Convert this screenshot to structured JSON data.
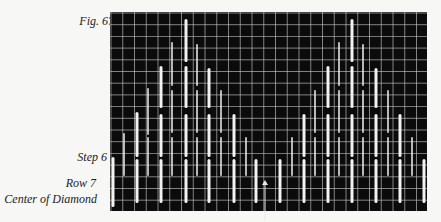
{
  "figure": {
    "caption": "Fig. 67",
    "labels": {
      "step": "Step 6",
      "row": "Row 7",
      "center": "Center of Diamond"
    }
  },
  "colors": {
    "background": "#0b0b0b",
    "grid": "#c8c8c8",
    "bar": "#f2f2f2",
    "page": "#f7f7f5"
  },
  "grid": {
    "left": 110,
    "top": 12,
    "right": 427,
    "bottom": 211,
    "spacing_x": 11.75,
    "spacing_y": 11.7
  },
  "diamonds": [
    {
      "name": "left",
      "bars": [
        {
          "x": 113,
          "w": 3,
          "segs": [
            [
              157,
              207
            ]
          ]
        },
        {
          "x": 124,
          "w": 1.5,
          "segs": [
            [
              133,
              176
            ]
          ]
        },
        {
          "x": 137,
          "w": 3,
          "segs": [
            [
              112,
              157
            ],
            [
              159,
              203
            ]
          ]
        },
        {
          "x": 148,
          "w": 1.5,
          "segs": [
            [
              88,
              135
            ],
            [
              137,
              176
            ]
          ]
        },
        {
          "x": 161,
          "w": 3,
          "segs": [
            [
              66,
              108
            ],
            [
              114,
              157
            ],
            [
              159,
              203
            ]
          ]
        },
        {
          "x": 172,
          "w": 1.5,
          "segs": [
            [
              42,
              86
            ],
            [
              90,
              133
            ],
            [
              137,
              176
            ]
          ]
        },
        {
          "x": 186,
          "w": 3,
          "segs": [
            [
              19,
              62
            ],
            [
              66,
              108
            ],
            [
              114,
              157
            ],
            [
              159,
              203
            ]
          ]
        },
        {
          "x": 197,
          "w": 1.5,
          "segs": [
            [
              44,
              86
            ],
            [
              90,
              133
            ],
            [
              137,
              176
            ]
          ]
        },
        {
          "x": 209,
          "w": 3,
          "segs": [
            [
              68,
              108
            ],
            [
              114,
              157
            ],
            [
              159,
              203
            ]
          ]
        },
        {
          "x": 221,
          "w": 1.5,
          "segs": [
            [
              90,
              133
            ],
            [
              137,
              176
            ]
          ]
        },
        {
          "x": 234,
          "w": 3,
          "segs": [
            [
              114,
              157
            ],
            [
              159,
              203
            ]
          ]
        },
        {
          "x": 246,
          "w": 1.5,
          "segs": [
            [
              137,
              176
            ]
          ]
        },
        {
          "x": 256,
          "w": 3,
          "segs": [
            [
              159,
              203
            ]
          ]
        }
      ]
    },
    {
      "name": "right",
      "bars": [
        {
          "x": 280,
          "w": 3,
          "segs": [
            [
              159,
              203
            ]
          ]
        },
        {
          "x": 292,
          "w": 1.5,
          "segs": [
            [
              137,
              176
            ]
          ]
        },
        {
          "x": 304,
          "w": 3,
          "segs": [
            [
              114,
              157
            ],
            [
              159,
              203
            ]
          ]
        },
        {
          "x": 315,
          "w": 1.5,
          "segs": [
            [
              90,
              133
            ],
            [
              137,
              176
            ]
          ]
        },
        {
          "x": 328,
          "w": 3,
          "segs": [
            [
              66,
              108
            ],
            [
              114,
              157
            ],
            [
              159,
              203
            ]
          ]
        },
        {
          "x": 339,
          "w": 1.5,
          "segs": [
            [
              42,
              86
            ],
            [
              90,
              133
            ],
            [
              137,
              176
            ]
          ]
        },
        {
          "x": 352,
          "w": 3,
          "segs": [
            [
              19,
              62
            ],
            [
              66,
              108
            ],
            [
              114,
              157
            ],
            [
              159,
              203
            ]
          ]
        },
        {
          "x": 363,
          "w": 1.5,
          "segs": [
            [
              44,
              86
            ],
            [
              90,
              133
            ],
            [
              137,
              176
            ]
          ]
        },
        {
          "x": 376,
          "w": 3,
          "segs": [
            [
              68,
              108
            ],
            [
              114,
              157
            ],
            [
              159,
              203
            ]
          ]
        },
        {
          "x": 388,
          "w": 1.5,
          "segs": [
            [
              90,
              133
            ],
            [
              137,
              176
            ]
          ]
        },
        {
          "x": 400,
          "w": 3,
          "segs": [
            [
              114,
              157
            ],
            [
              159,
              203
            ]
          ]
        },
        {
          "x": 412,
          "w": 1.5,
          "segs": [
            [
              137,
              176
            ]
          ]
        },
        {
          "x": 424,
          "w": 3,
          "segs": [
            [
              159,
              203
            ]
          ]
        }
      ]
    }
  ],
  "arrow": {
    "x": 265,
    "y1": 180,
    "y2": 221
  }
}
